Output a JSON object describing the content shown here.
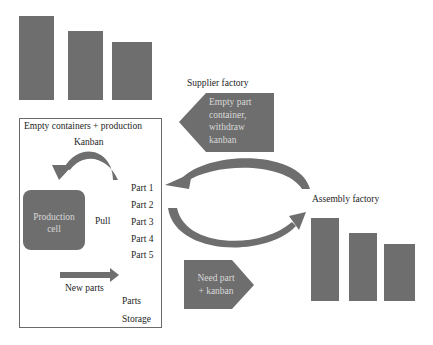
{
  "colors": {
    "shape_fill": "#6e6e6e",
    "box_stroke": "#6a6a6a",
    "text_dark": "#1e1e1e",
    "text_light": "#d8d8d8",
    "background": "#ffffff"
  },
  "supplier": {
    "title": "Supplier factory",
    "signal_lines": [
      "Empty part",
      "container,",
      "withdraw",
      "kanban"
    ]
  },
  "assembly": {
    "title": "Assembly factory",
    "signal_lines": [
      "Need part",
      "+ kanban"
    ]
  },
  "production_box": {
    "title": "Empty containers + production",
    "kanban_label": "Kanban",
    "cell_lines": [
      "Production",
      "cell"
    ],
    "pull_label": "Pull",
    "parts": [
      "Part 1",
      "Part 2",
      "Part 3",
      "Part 4",
      "Part 5"
    ],
    "new_parts_label": "New parts",
    "storage_lines": [
      "Parts",
      "Storage"
    ]
  },
  "icons": {
    "supplier_building": "factory-bars-icon",
    "assembly_building": "factory-bars-icon",
    "withdraw_flow": "curved-arrow-left-icon",
    "delivery_flow": "curved-arrow-right-icon",
    "kanban_loop": "curved-arrow-icon",
    "new_parts_flow": "arrow-right-icon"
  }
}
